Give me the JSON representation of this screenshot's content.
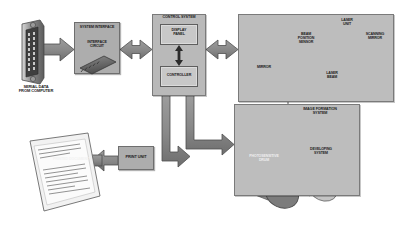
{
  "diagram": {
    "background_color": "#ffffff",
    "panel_fill": "#b9b9b9",
    "block_fill": "#adadad",
    "inner_block_fill": "#c8c8c8",
    "arrow_fill": "#8c8c8c",
    "outline_color": "#5e5e5e",
    "text_color": "#1c1c1c"
  },
  "input": {
    "connector_name": "db25-serial-connector",
    "caption": "SERIAL DATA\nFROM COMPUTER"
  },
  "system_interface": {
    "title": "SYSTEM INTERFACE",
    "circuit_label": "INTERFACE\nCIRCUIT",
    "chip_name": "integrated-circuit-chip"
  },
  "control_system": {
    "title": "CONTROL SYSTEM",
    "display_panel": "DISPLAY\nPANEL",
    "controller": "CONTROLLER"
  },
  "laser_scanner": {
    "title": "",
    "beam_position_sensor": "BEAM\nPOSITION\nSENSOR",
    "laser_unit": "LASER\nUNIT",
    "scanning_mirror": "SCANNING\nMIRROR",
    "mirror": "MIRROR",
    "laser_beam": "LASER\nBEAM"
  },
  "image_formation": {
    "title": "IMAGE FORMATION\nSYSTEM",
    "drum": "PHOTOSENSITIVE\nDRUM",
    "developing_system": "DEVELOPING\nSYSTEM"
  },
  "print_unit": {
    "label": "PRINT UNIT",
    "output_label": "PRINTED DOCUMENT",
    "page_name": "printed-page"
  }
}
